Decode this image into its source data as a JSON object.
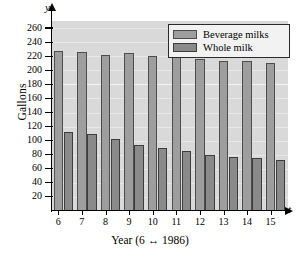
{
  "chart_data": {
    "type": "bar",
    "title": "",
    "xlabel": "Year (6 ↔ 1986)",
    "ylabel": "Gallons",
    "x_axis_symbol": "t",
    "y_axis_symbol": "y",
    "categories": [
      "6",
      "7",
      "8",
      "9",
      "10",
      "11",
      "12",
      "13",
      "14",
      "15"
    ],
    "ylim": [
      0,
      270
    ],
    "yticks": [
      260,
      240,
      220,
      200,
      180,
      160,
      140,
      120,
      100,
      80,
      60,
      40,
      20
    ],
    "grid": true,
    "legend_position": "top-right",
    "series": [
      {
        "name": "Beverage milks",
        "color": "#9e9e9e",
        "values": [
          228,
          226,
          222,
          224,
          221,
          220,
          216,
          213,
          213,
          211
        ]
      },
      {
        "name": "Whole milk",
        "color": "#8a8a8a",
        "values": [
          113,
          109,
          102,
          94,
          89,
          86,
          80,
          77,
          75,
          73
        ]
      }
    ]
  }
}
